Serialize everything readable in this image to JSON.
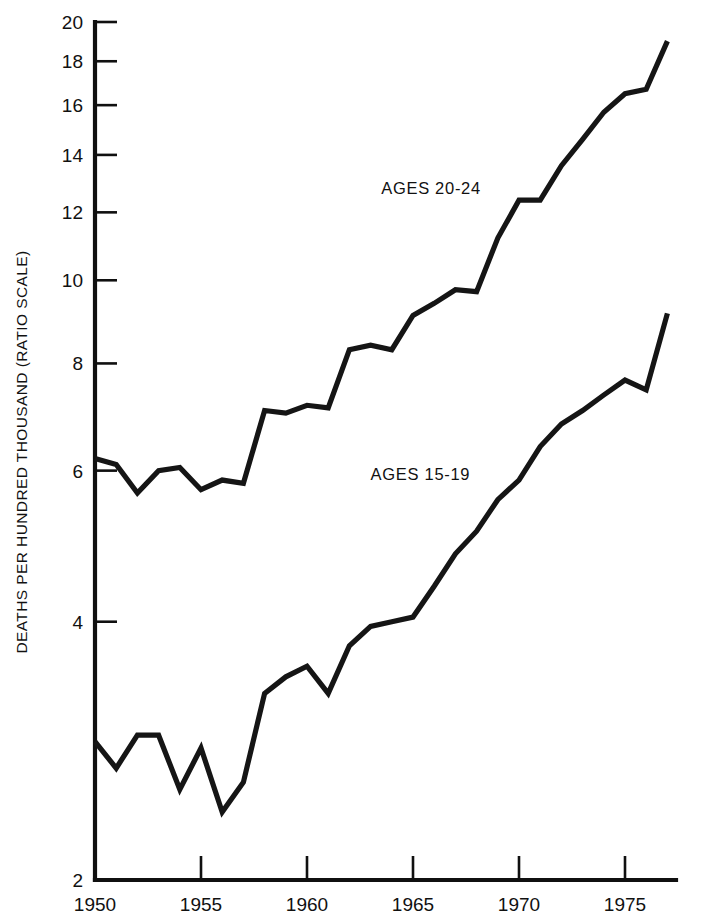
{
  "chart_data": {
    "type": "line",
    "title": "",
    "subtitle": "",
    "xlabel": "",
    "ylabel": "DEATHS PER HUNDRED THOUSAND (RATIO SCALE)",
    "yscale": "log",
    "ylim": [
      2,
      20
    ],
    "xlim": [
      1950,
      1977
    ],
    "grid": false,
    "legend_position": "inline-annotation",
    "ytick_labels": [
      "20",
      "18",
      "16",
      "14",
      "12",
      "10",
      "8",
      "6",
      "4",
      "2"
    ],
    "ytick_values": [
      20,
      18,
      16,
      14,
      12,
      10,
      8,
      6,
      4,
      2
    ],
    "xtick_labels": [
      "1950",
      "1955",
      "1960",
      "1965",
      "1970",
      "1975"
    ],
    "xtick_values": [
      1950,
      1955,
      1960,
      1965,
      1970,
      1975
    ],
    "x": [
      1950,
      1951,
      1952,
      1953,
      1954,
      1955,
      1956,
      1957,
      1958,
      1959,
      1960,
      1961,
      1962,
      1963,
      1964,
      1965,
      1966,
      1967,
      1968,
      1969,
      1970,
      1971,
      1972,
      1973,
      1974,
      1975,
      1976,
      1977
    ],
    "series": [
      {
        "name": "AGES 20-24",
        "label": "AGES 20-24",
        "color": "#151515",
        "values": [
          6.2,
          6.1,
          5.65,
          6.0,
          6.05,
          5.7,
          5.85,
          5.8,
          7.05,
          7.0,
          7.15,
          7.1,
          8.3,
          8.4,
          8.3,
          9.1,
          9.4,
          9.75,
          9.7,
          11.2,
          12.4,
          12.4,
          13.6,
          14.6,
          15.7,
          16.5,
          16.7,
          19.0
        ]
      },
      {
        "name": "AGES 15-19",
        "label": "AGES 15-19",
        "color": "#151515",
        "values": [
          2.9,
          2.7,
          2.95,
          2.95,
          2.55,
          2.85,
          2.4,
          2.6,
          3.3,
          3.45,
          3.55,
          3.3,
          3.75,
          3.95,
          4.0,
          4.05,
          4.4,
          4.8,
          5.1,
          5.55,
          5.85,
          6.4,
          6.8,
          7.05,
          7.35,
          7.65,
          7.45,
          9.15
        ]
      }
    ],
    "annotations": [
      {
        "text": "AGES 20-24",
        "x_year": 1963.5,
        "y_value": 12.6
      },
      {
        "text": "AGES 15-19",
        "x_year": 1963.0,
        "y_value": 5.85
      }
    ]
  }
}
